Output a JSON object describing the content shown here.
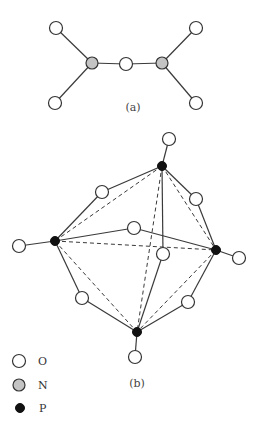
{
  "figure_a": {
    "label": "(a)",
    "label_pos": [
      133,
      111
    ],
    "atoms": [
      {
        "id": "O1",
        "type": "O",
        "x": 56,
        "y": 28
      },
      {
        "id": "O2",
        "type": "O",
        "x": 55,
        "y": 103
      },
      {
        "id": "N1",
        "type": "N",
        "x": 92,
        "y": 63
      },
      {
        "id": "O3",
        "type": "O",
        "x": 126,
        "y": 64
      },
      {
        "id": "N2",
        "type": "N",
        "x": 162,
        "y": 63
      },
      {
        "id": "O4",
        "type": "O",
        "x": 196,
        "y": 28
      },
      {
        "id": "O5",
        "type": "O",
        "x": 196,
        "y": 103
      }
    ],
    "bonds": [
      [
        "O1",
        "N1"
      ],
      [
        "O2",
        "N1"
      ],
      [
        "N1",
        "O3"
      ],
      [
        "O3",
        "N2"
      ],
      [
        "N2",
        "O4"
      ],
      [
        "N2",
        "O5"
      ]
    ]
  },
  "figure_b": {
    "label": "(b)",
    "label_pos": [
      137,
      387
    ],
    "atoms": [
      {
        "id": "Pt",
        "type": "P",
        "x": 162,
        "y": 166
      },
      {
        "id": "Pl",
        "type": "P",
        "x": 55,
        "y": 241
      },
      {
        "id": "Pr",
        "type": "P",
        "x": 216,
        "y": 250
      },
      {
        "id": "Pb",
        "type": "P",
        "x": 137,
        "y": 332
      },
      {
        "id": "Ot",
        "type": "O",
        "x": 169,
        "y": 139
      },
      {
        "id": "Ol",
        "type": "O",
        "x": 19,
        "y": 246
      },
      {
        "id": "Or",
        "type": "O",
        "x": 239,
        "y": 258
      },
      {
        "id": "Ob",
        "type": "O",
        "x": 135,
        "y": 357
      },
      {
        "id": "Otl",
        "type": "O",
        "x": 102,
        "y": 192
      },
      {
        "id": "Otr",
        "type": "O",
        "x": 196,
        "y": 199
      },
      {
        "id": "Olr",
        "type": "O",
        "x": 134,
        "y": 228
      },
      {
        "id": "Otb",
        "type": "O",
        "x": 163,
        "y": 254
      },
      {
        "id": "Olb",
        "type": "O",
        "x": 82,
        "y": 298
      },
      {
        "id": "Orb",
        "type": "O",
        "x": 188,
        "y": 302
      }
    ],
    "bonds": [
      [
        "Pt",
        "Ot"
      ],
      [
        "Pl",
        "Ol"
      ],
      [
        "Pr",
        "Or"
      ],
      [
        "Pb",
        "Ob"
      ],
      [
        "Pt",
        "Otl"
      ],
      [
        "Otl",
        "Pl"
      ],
      [
        "Pt",
        "Otr"
      ],
      [
        "Otr",
        "Pr"
      ],
      [
        "Pl",
        "Olr"
      ],
      [
        "Olr",
        "Pr"
      ],
      [
        "Pt",
        "Otb"
      ],
      [
        "Otb",
        "Pb"
      ],
      [
        "Pl",
        "Olb"
      ],
      [
        "Olb",
        "Pb"
      ],
      [
        "Pr",
        "Orb"
      ],
      [
        "Orb",
        "Pb"
      ]
    ],
    "dashed_edges": [
      [
        "Pt",
        "Pl"
      ],
      [
        "Pt",
        "Pr"
      ],
      [
        "Pl",
        "Pr"
      ],
      [
        "Pt",
        "Pb"
      ],
      [
        "Pl",
        "Pb"
      ],
      [
        "Pr",
        "Pb"
      ]
    ]
  },
  "legend": {
    "items": [
      {
        "type": "O",
        "label": "O",
        "x": 19,
        "y": 361
      },
      {
        "type": "N",
        "label": "N",
        "x": 19,
        "y": 385
      },
      {
        "type": "P",
        "label": "P",
        "x": 20,
        "y": 408
      }
    ]
  },
  "style": {
    "o_radius": 6.5,
    "n_radius": 6,
    "p_radius": 4.5,
    "n_fill": "#c4c4c4",
    "p_fill": "#111111",
    "line_color": "#3a3a3a"
  }
}
